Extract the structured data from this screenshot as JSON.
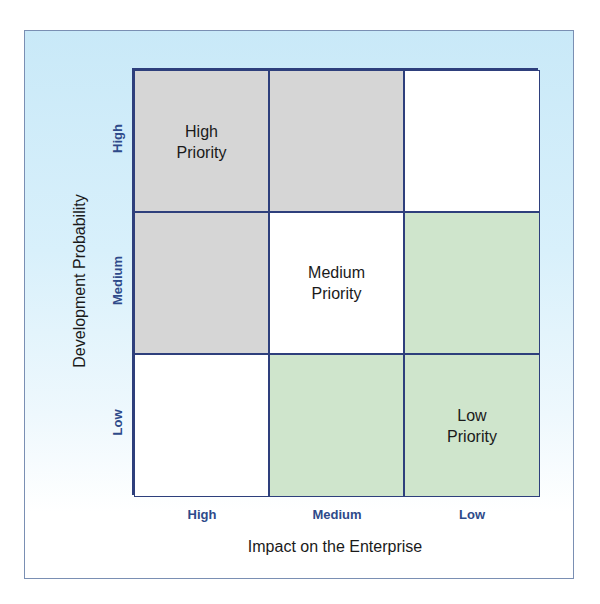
{
  "diagram": {
    "type": "priority-matrix-3x3",
    "x_axis": {
      "title": "Impact on the Enterprise",
      "ticks": [
        "High",
        "Medium",
        "Low"
      ]
    },
    "y_axis": {
      "title": "Development Probability",
      "ticks_top_to_bottom": [
        "High",
        "Medium",
        "Low"
      ]
    },
    "cells": [
      {
        "row": 0,
        "col": 0,
        "fill": "gray",
        "label": "High\nPriority"
      },
      {
        "row": 0,
        "col": 1,
        "fill": "gray",
        "label": ""
      },
      {
        "row": 0,
        "col": 2,
        "fill": "white",
        "label": ""
      },
      {
        "row": 1,
        "col": 0,
        "fill": "gray",
        "label": ""
      },
      {
        "row": 1,
        "col": 1,
        "fill": "white",
        "label": "Medium\nPriority"
      },
      {
        "row": 1,
        "col": 2,
        "fill": "green",
        "label": ""
      },
      {
        "row": 2,
        "col": 0,
        "fill": "white",
        "label": ""
      },
      {
        "row": 2,
        "col": 1,
        "fill": "green",
        "label": ""
      },
      {
        "row": 2,
        "col": 2,
        "fill": "green",
        "label": "Low\nPriority"
      }
    ],
    "colors": {
      "gray": "#d6d6d6",
      "white": "#ffffff",
      "green": "#cfe5cc",
      "grid_lines": "#2e3f7c",
      "tick_text": "#2e4a8a",
      "background_top": "#c9e9f8"
    }
  }
}
